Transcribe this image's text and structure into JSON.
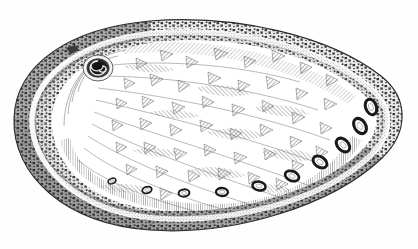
{
  "figure": {
    "domain": "natural-image",
    "kind": "scientific-illustration",
    "technique": "engraving / pen-and-ink line hatching",
    "title": "",
    "caption": "",
    "label": "",
    "background_color": "#fefefe",
    "ink_color": "#2b2b2b",
    "mid_ink_color": "#6d6d6d",
    "light_ink_color": "#a8a8a8",
    "canvas": {
      "width": 418,
      "height": 249
    }
  },
  "outline": {
    "name": "shell-outline",
    "description": "broad oval, widest horizontally, apex/spire at upper-left, rounded right end",
    "bbox": {
      "x": 12,
      "y": 18,
      "width": 394,
      "height": 215
    },
    "center": {
      "x": 209,
      "y": 124
    }
  },
  "apex": {
    "name": "spire-apex",
    "description": "dark inked spiral protoconch at upper-left of shell",
    "center": {
      "x": 98,
      "y": 68
    },
    "radius": 14,
    "turns": 2.6,
    "color": "#161616"
  },
  "respiratory_holes": {
    "name": "respiratory-hole-row",
    "description": "row of open oval perforations along the lower-right margin, increasing in size toward the right",
    "count": 10,
    "color": "#1a1a1a",
    "items": [
      {
        "cx": 112,
        "cy": 181,
        "rx": 4.0,
        "ry": 2.6,
        "rot": -22
      },
      {
        "cx": 147,
        "cy": 190,
        "rx": 4.8,
        "ry": 3.2,
        "rot": -14
      },
      {
        "cx": 184,
        "cy": 193,
        "rx": 5.4,
        "ry": 3.6,
        "rot": -6
      },
      {
        "cx": 222,
        "cy": 192,
        "rx": 6.0,
        "ry": 4.0,
        "rot": 2
      },
      {
        "cx": 259,
        "cy": 186,
        "rx": 6.6,
        "ry": 4.4,
        "rot": 12
      },
      {
        "cx": 292,
        "cy": 176,
        "rx": 7.2,
        "ry": 4.8,
        "rot": 22
      },
      {
        "cx": 320,
        "cy": 162,
        "rx": 7.6,
        "ry": 5.2,
        "rot": 34
      },
      {
        "cx": 343,
        "cy": 145,
        "rx": 8.0,
        "ry": 5.4,
        "rot": 46
      },
      {
        "cx": 360,
        "cy": 126,
        "rx": 8.2,
        "ry": 5.6,
        "rot": 58
      },
      {
        "cx": 371,
        "cy": 107,
        "rx": 8.0,
        "ry": 5.4,
        "rot": 70
      }
    ]
  },
  "rim_bands": {
    "name": "shell-margin-bands",
    "outer_mottled": {
      "name": "outer-mottled-band",
      "description": "dark irregular blotched band following the outer edge",
      "color": "#3a3a3a"
    },
    "inner_stipple": {
      "name": "inner-stippled-band",
      "description": "pale stippled/granular band just inside the dark rim",
      "color": "#9a9a9a"
    },
    "groove": {
      "name": "margin-groove",
      "description": "narrow white channel separating the two rim bands",
      "color": "#ffffff"
    }
  },
  "interior": {
    "name": "nacre-interior",
    "description": "interior face bearing scattered triangular and chevron hatch marks with sweeping growth lines",
    "triangle_marks": 46,
    "growth_lines": 9,
    "mark_color": "#5e5e5e"
  },
  "texture": {
    "hatch_spacing_px": 2,
    "stipple_density": "fine",
    "line_weight_px": 0.7
  }
}
